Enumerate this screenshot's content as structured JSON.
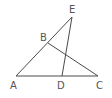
{
  "figure": {
    "type": "geometry",
    "line_color": "#4a4a4a",
    "label_color": "#555555",
    "points": [
      {
        "name": "A",
        "x": 16,
        "y": 76
      },
      {
        "name": "B",
        "x": 48,
        "y": 43
      },
      {
        "name": "C",
        "x": 98,
        "y": 76
      },
      {
        "name": "D",
        "x": 62,
        "y": 76
      },
      {
        "name": "E",
        "x": 72,
        "y": 17
      }
    ],
    "segments": [
      [
        "A",
        "E"
      ],
      [
        "B",
        "C"
      ],
      [
        "E",
        "D"
      ],
      [
        "A",
        "C"
      ]
    ],
    "labels": {
      "A": "A",
      "B": "B",
      "C": "C",
      "D": "D",
      "E": "E"
    }
  }
}
